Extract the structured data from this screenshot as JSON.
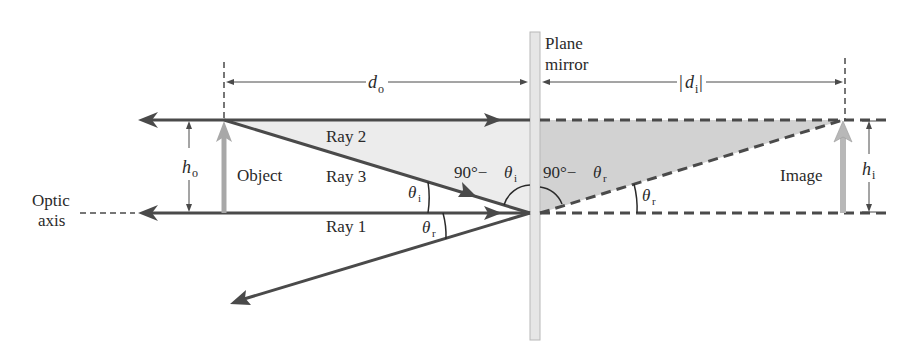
{
  "diagram": {
    "colors": {
      "ray": "#4a4a4a",
      "object_arrow": "#a8a8a8",
      "light_fill": "#ececec",
      "dark_fill": "#d2d2d2",
      "mirror": "#e6e6e6",
      "mirror_edge": "#b8b8b8",
      "text": "#2a2a2a"
    },
    "labels": {
      "mirror_line1": "Plane",
      "mirror_line2": "mirror",
      "optic_line1": "Optic",
      "optic_line2": "axis",
      "object": "Object",
      "image": "Image",
      "ray1": "Ray 1",
      "ray2": "Ray 2",
      "ray3": "Ray 3",
      "d_o_main": "d",
      "d_o_sub": "o",
      "d_i_main": "d",
      "d_i_sub": "i",
      "h_o_main": "h",
      "h_o_sub": "o",
      "h_i_main": "h",
      "h_i_sub": "i",
      "theta_main": "θ",
      "sub_i": "i",
      "sub_r": "r",
      "complement_prefix": "90°−",
      "abs_bar": "|"
    }
  }
}
